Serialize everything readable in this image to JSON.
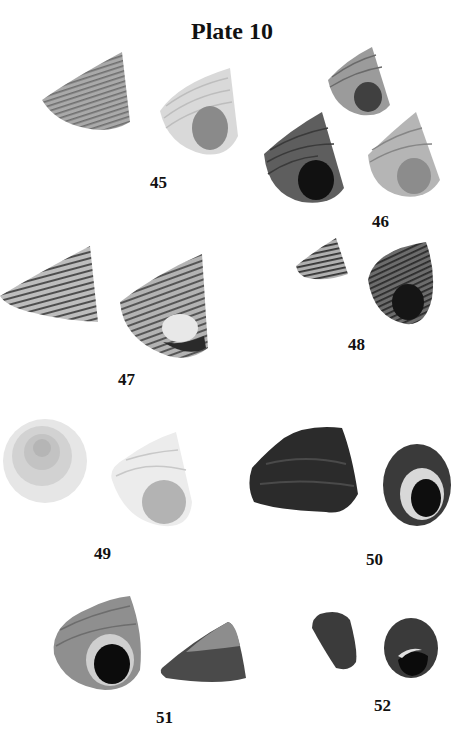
{
  "page": {
    "title": "Plate 10",
    "figures": [
      {
        "number": "45",
        "specimens": 2
      },
      {
        "number": "46",
        "specimens": 3
      },
      {
        "number": "47",
        "specimens": 2
      },
      {
        "number": "48",
        "specimens": 2
      },
      {
        "number": "49",
        "specimens": 2
      },
      {
        "number": "50",
        "specimens": 2
      },
      {
        "number": "51",
        "specimens": 2
      },
      {
        "number": "52",
        "specimens": 2
      }
    ]
  }
}
